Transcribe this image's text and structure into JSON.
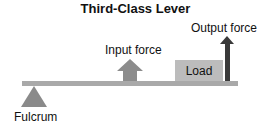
{
  "diagram": {
    "title": "Third-Class Lever",
    "labels": {
      "fulcrum": "Fulcrum",
      "input_force": "Input force",
      "output_force": "Output force",
      "load": "Load"
    },
    "colors": {
      "lever": "#a9a9a9",
      "fulcrum": "#8a8a8a",
      "input_arrow": "#8c8c8c",
      "load_box": "#bcbcbc",
      "output_arrow": "#3a3a3a"
    }
  }
}
